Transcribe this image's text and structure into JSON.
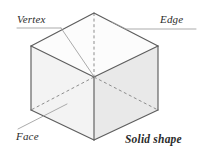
{
  "figure": {
    "title": "Solid shape",
    "labels": {
      "vertex": "Vertex",
      "edge": "Edge",
      "face": "Face",
      "caption": "Solid shape"
    },
    "shape": {
      "name": "cube",
      "visible_faces": [
        "top",
        "left",
        "right"
      ],
      "hidden_edges_style": "dashed"
    },
    "colors": {
      "edge_stroke": "#5a5a5a",
      "hidden_edge_stroke": "#8a8a8a",
      "leader_stroke": "#9a9a9a",
      "top_face_fill": "#fcfcfc",
      "left_face_fill": "#f2f2f2",
      "right_face_fill": "#e9e9e9",
      "text": "#2b2b2b",
      "background": "#ffffff"
    },
    "geometry": {
      "top_back": [
        94,
        13
      ],
      "top_left": [
        31,
        46
      ],
      "top_right": [
        158,
        46
      ],
      "top_front": [
        94,
        77
      ],
      "bottom_left": [
        31,
        110
      ],
      "bottom_right": [
        158,
        110
      ],
      "bottom_front": [
        94,
        140
      ],
      "bottom_back": [
        94,
        77
      ]
    },
    "leaders": {
      "vertex": {
        "from": [
          19,
          28
        ],
        "to": [
          94,
          77
        ],
        "underline_to": [
          64,
          28
        ]
      },
      "edge": {
        "from": [
          196,
          29
        ],
        "to": [
          124,
          29
        ],
        "elbow_to": [
          104,
          19
        ]
      },
      "face": {
        "from": [
          19,
          129
        ],
        "to": [
          66,
          104
        ]
      }
    }
  }
}
